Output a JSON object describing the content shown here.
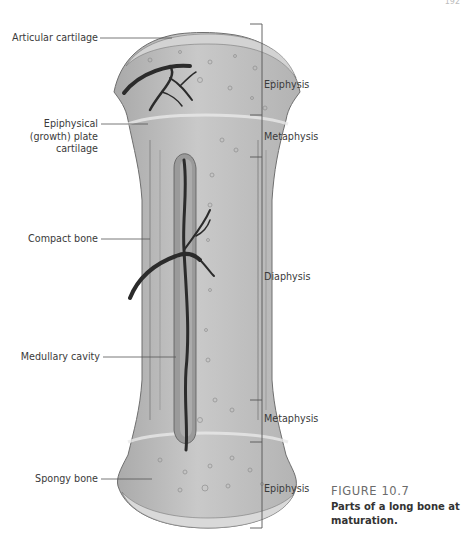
{
  "page": {
    "number": "192"
  },
  "figure": {
    "number": "FIGURE 10.7",
    "title": "Parts of a long bone at maturation.",
    "colors": {
      "bone_fill": "#b9b9b9",
      "bone_light": "#d6d6d6",
      "bone_outline": "#6f6f6f",
      "vessel": "#2b2b2b",
      "label_line": "#555555"
    }
  },
  "left_labels": [
    {
      "id": "articular-cartilage",
      "text": "Articular cartilage"
    },
    {
      "id": "epiphyseal-plate",
      "line1": "Epiphysical",
      "line2": "(growth) plate",
      "line3": "cartilage"
    },
    {
      "id": "compact-bone",
      "text": "Compact bone"
    },
    {
      "id": "medullary-cavity",
      "text": "Medullary cavity"
    },
    {
      "id": "spongy-bone",
      "text": "Spongy bone"
    }
  ],
  "regions": [
    {
      "id": "epiphysis-top",
      "text": "Epiphysis"
    },
    {
      "id": "metaphysis-top",
      "text": "Metaphysis"
    },
    {
      "id": "diaphysis",
      "text": "Diaphysis"
    },
    {
      "id": "metaphysis-bottom",
      "text": "Metaphysis"
    },
    {
      "id": "epiphysis-bottom",
      "text": "Epiphysis"
    }
  ]
}
